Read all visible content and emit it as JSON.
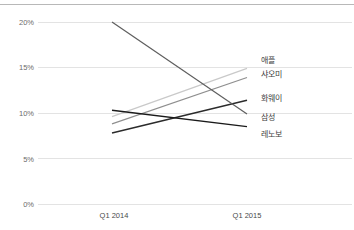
{
  "chart_data": {
    "type": "line",
    "title": "",
    "subtitle": "",
    "xlabel": "",
    "ylabel": "",
    "x": [
      "Q1 2014",
      "Q1 2015"
    ],
    "categories": [
      "Q1 2014",
      "Q1 2015"
    ],
    "ylim": [
      0,
      20
    ],
    "xlim": [
      0,
      1
    ],
    "yticks": [
      0,
      5,
      10,
      15,
      20
    ],
    "ytick_labels": [
      "0%",
      "5%",
      "10%",
      "15%",
      "20%"
    ],
    "xtick_labels": [
      "Q1 2014",
      "Q1 2015"
    ],
    "grid": true,
    "grid_axis": "y",
    "legend_position": "right-inline",
    "value_suffix": "%",
    "series": [
      {
        "name": "애플",
        "values": [
          9.6,
          14.9
        ],
        "color": "#c9c9c9",
        "width": 1.2
      },
      {
        "name": "샤오미",
        "values": [
          8.8,
          13.9
        ],
        "color": "#8f8f8f",
        "width": 1.2
      },
      {
        "name": "화웨이",
        "values": [
          7.8,
          11.4
        ],
        "color": "#2b2b2b",
        "width": 1.4
      },
      {
        "name": "삼성",
        "values": [
          20.0,
          9.9
        ],
        "color": "#5e5e5e",
        "width": 1.2
      },
      {
        "name": "레노보",
        "values": [
          10.3,
          8.5
        ],
        "color": "#1a1a1a",
        "width": 1.4
      }
    ]
  },
  "axis": {
    "ytick_0": "0%",
    "ytick_1": "5%",
    "ytick_2": "10%",
    "ytick_3": "15%",
    "ytick_4": "20%",
    "xtick_0": "Q1 2014",
    "xtick_1": "Q1 2015"
  },
  "legend": {
    "item_0": "애플",
    "item_1": "샤오미",
    "item_2": "화웨이",
    "item_3": "삼성",
    "item_4": "레노보"
  },
  "style": {
    "background": "#ffffff",
    "gridline_color": "#e3e3e3",
    "border_color": "#b8b8b8",
    "tick_text_color": "#6b6b6b",
    "label_text_color": "#3d3d3d"
  }
}
